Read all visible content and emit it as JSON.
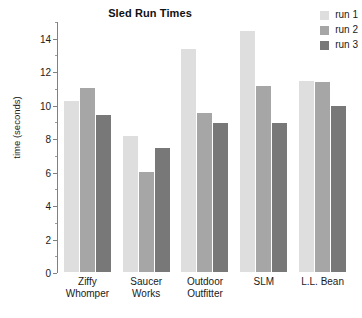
{
  "chart_data": {
    "type": "bar",
    "title": "Sled Run Times",
    "xlabel": "",
    "ylabel": "time (seconds)",
    "categories": [
      "Ziffy Whomper",
      "Saucer Works",
      "Outdoor Outfitter",
      "SLM",
      "L.L. Bean"
    ],
    "category_lines": [
      [
        "Ziffy",
        "Whomper"
      ],
      [
        "Saucer",
        "Works"
      ],
      [
        "Outdoor",
        "Outfitter"
      ],
      [
        "SLM",
        ""
      ],
      [
        "L.L. Bean",
        ""
      ]
    ],
    "series": [
      {
        "name": "run 1",
        "color": "#dedede",
        "values": [
          10.2,
          8.1,
          13.35,
          14.4,
          11.4
        ]
      },
      {
        "name": "run 2",
        "color": "#a6a6a6",
        "values": [
          11.0,
          6.0,
          9.5,
          11.1,
          11.35
        ]
      },
      {
        "name": "run 3",
        "color": "#787878",
        "values": [
          9.4,
          7.4,
          8.9,
          8.9,
          9.9
        ]
      }
    ],
    "ylim": [
      0,
      15
    ],
    "ytick_major": [
      0,
      2,
      4,
      6,
      8,
      10,
      12,
      14
    ],
    "ytick_minor": [
      1,
      3,
      5,
      7,
      9,
      11,
      13,
      15
    ],
    "ytick_labels": [
      "0",
      "2",
      "4",
      "6",
      "8",
      "10",
      "12",
      "14"
    ],
    "grid": false,
    "legend_position": "top-right",
    "axis_color": "#808080",
    "background": "#ffffff"
  }
}
